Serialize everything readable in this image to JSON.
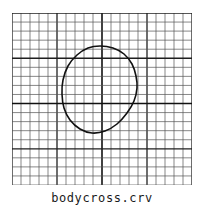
{
  "figure": {
    "caption": "bodycross.crv",
    "background_color": "#ffffff",
    "outer_border_color": "#dcdcdc"
  },
  "plot": {
    "grid": {
      "columns": 20,
      "rows": 19,
      "cell_width": 9,
      "cell_height": 9,
      "minor_color": "#555555",
      "major_color": "#1f1f1f",
      "minor_width": 0.7,
      "major_width": 1.3,
      "major_every": 5,
      "axis_color": "#111111",
      "axis_width": 1.6,
      "axis_x_index": 10,
      "axis_y_index": 10,
      "x_range": [
        0,
        180
      ],
      "y_range": [
        0,
        171
      ]
    },
    "curve": {
      "name": "bodycross.crv",
      "type": "closed-contour",
      "stroke_color": "#111111",
      "stroke_width": 1.6,
      "fill": "none",
      "bbox_px": {
        "x": 50,
        "y": 33,
        "width": 75,
        "height": 87
      },
      "points": [
        [
          88,
          33
        ],
        [
          101,
          35
        ],
        [
          112,
          41
        ],
        [
          120,
          51
        ],
        [
          124,
          63
        ],
        [
          125,
          75
        ],
        [
          122,
          88
        ],
        [
          115,
          100
        ],
        [
          105,
          111
        ],
        [
          93,
          118
        ],
        [
          80,
          120
        ],
        [
          68,
          116
        ],
        [
          58,
          107
        ],
        [
          52,
          95
        ],
        [
          50,
          81
        ],
        [
          51,
          67
        ],
        [
          56,
          53
        ],
        [
          65,
          42
        ],
        [
          76,
          35
        ],
        [
          88,
          33
        ]
      ]
    }
  }
}
